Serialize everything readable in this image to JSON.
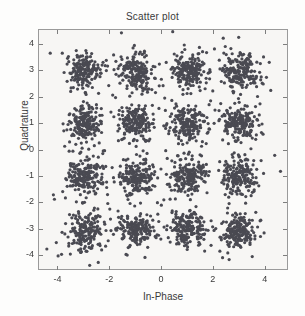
{
  "figure": {
    "title": "Scatter plot",
    "marker_color": "#4a4a52",
    "axes_color": "#9a9a9a",
    "plot_background": "#f7f6f4",
    "figure_background": "#fdfdfc"
  },
  "axes": {
    "xlabel": "In-Phase",
    "ylabel": "Quadrature",
    "xticks": [
      "-4",
      "-2",
      "0",
      "2",
      "4"
    ],
    "yticks": [
      "4",
      "3",
      "2",
      "1",
      "0",
      "-1",
      "-2",
      "-3",
      "-4"
    ]
  },
  "chart_data": {
    "type": "scatter",
    "title": "Scatter plot",
    "xlabel": "In-Phase",
    "ylabel": "Quadrature",
    "xlim": [
      -4.75,
      4.9
    ],
    "ylim": [
      -4.55,
      4.55
    ],
    "xticks": [
      -4,
      -2,
      0,
      2,
      4
    ],
    "yticks": [
      4,
      3,
      2,
      1,
      0,
      -1,
      -2,
      -3,
      -4
    ],
    "grid": false,
    "legend": null,
    "marker": "dot",
    "marker_size": 1.6,
    "color": "#4a4a52",
    "cluster_centers": [
      [
        -3,
        3
      ],
      [
        -1,
        3
      ],
      [
        1,
        3
      ],
      [
        3,
        3
      ],
      [
        -3,
        1
      ],
      [
        -1,
        1
      ],
      [
        1,
        1
      ],
      [
        3,
        1
      ],
      [
        -3,
        -1
      ],
      [
        -1,
        -1
      ],
      [
        1,
        -1
      ],
      [
        3,
        -1
      ],
      [
        -3,
        -3
      ],
      [
        -1,
        -3
      ],
      [
        1,
        -3
      ],
      [
        3,
        -3
      ]
    ],
    "points_per_cluster": 190,
    "cluster_sigma": 0.33,
    "total_points": 3040
  }
}
